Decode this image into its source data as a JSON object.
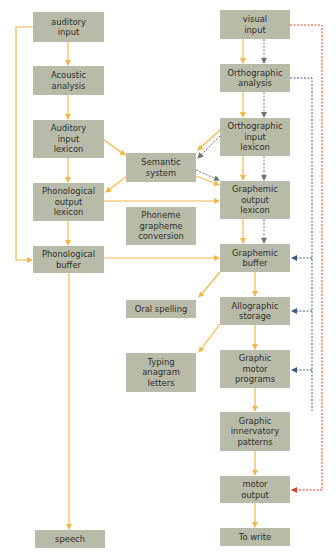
{
  "colors": {
    "node_fill": "#b8bba8",
    "text": "#2e2e2a",
    "arrow_main": "#f2b84b",
    "arrow_gray": "#7a7f78",
    "arrow_blue": "#3a5f8a",
    "arrow_red": "#e0402a"
  },
  "nodes": {
    "auditory_input": "auditory\ninput",
    "acoustic_analysis": "Acoustic\nanalysis",
    "auditory_input_lexicon": "Auditory\ninput\nlexicon",
    "semantic_system": "Semantic\nsystem",
    "phonological_output_lexicon": "Phonological\noutput\nlexicon",
    "phoneme_grapheme_conversion": "Phoneme\ngrapheme\nconversion",
    "phonological_buffer": "Phonological\nbuffer",
    "oral_spelling": "Oral spelling",
    "typing_anagram_letters": "Typing\nanagram\nletters",
    "speech": "speech",
    "visual_input": "visual\ninput",
    "orthographic_analysis": "Orthographic\nanalysis",
    "orthographic_input_lexicon": "Orthographic\ninput\nlexicon",
    "graphemic_output_lexicon": "Graphemic\noutput\nlexicon",
    "graphemic_buffer": "Graphemic\nbuffer",
    "allographic_storage": "Allographic\nstorage",
    "graphic_motor_programs": "Graphic\nmotor\nprograms",
    "graphic_innervatory_patterns": "Graphic\ninnervatory\npatterns",
    "motor_output": "motor\noutput",
    "to_write": "To write"
  }
}
